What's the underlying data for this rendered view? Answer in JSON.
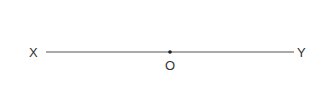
{
  "diagram": {
    "line": {
      "x1": 46,
      "y1": 52,
      "x2": 294,
      "y2": 52,
      "color": "#555555"
    },
    "labels": {
      "left": "X",
      "right": "Y",
      "point": "O"
    },
    "point": {
      "x": 170,
      "y": 52,
      "color": "#222222"
    }
  }
}
